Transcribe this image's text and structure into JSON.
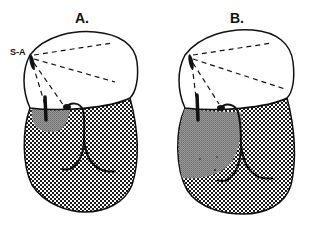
{
  "diagram": {
    "panels": [
      {
        "label": "A.",
        "annotation": "S-A",
        "shaded_zone": "small"
      },
      {
        "label": "B.",
        "annotation": "",
        "shaded_zone": "large"
      }
    ]
  },
  "colors": {
    "outline": "#111111",
    "stipple_dark": "#1a1a1a",
    "stipple_light": "#ffffff",
    "shaded_zone": "#8a8a8a"
  }
}
